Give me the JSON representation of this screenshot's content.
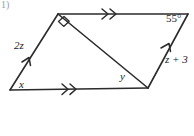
{
  "figure": {
    "type": "parallelogram-with-diagonal",
    "problem_number": "1)",
    "background_color": "#ffffff",
    "stroke_color": "#2b2b2b",
    "label_color": "#1c1c1c",
    "vertices": {
      "bottom_left": {
        "x": 10,
        "y": 90
      },
      "top_left": {
        "x": 58,
        "y": 14
      },
      "top_right": {
        "x": 188,
        "y": 14
      },
      "bottom_right": {
        "x": 148,
        "y": 88
      }
    },
    "sides": [
      {
        "name": "top-side",
        "from": "top_left",
        "to": "top_right",
        "tick_mark": "double-arrow",
        "label": ""
      },
      {
        "name": "bottom-side",
        "from": "bottom_left",
        "to": "bottom_right",
        "tick_mark": "double-arrow",
        "label": ""
      },
      {
        "name": "left-side",
        "from": "bottom_left",
        "to": "top_left",
        "tick_mark": "single-arrow",
        "label": "2z"
      },
      {
        "name": "right-side",
        "from": "bottom_right",
        "to": "top_right",
        "tick_mark": "single-arrow",
        "label": "z + 3"
      }
    ],
    "diagonal": {
      "name": "diagonal",
      "from": "top_left",
      "to": "bottom_right"
    },
    "angles": [
      {
        "name": "angle-x",
        "at": "bottom_left",
        "label": "x",
        "marker": "none"
      },
      {
        "name": "angle-right-angle",
        "at": "top_left",
        "label": "",
        "marker": "right-angle-square"
      },
      {
        "name": "angle-55",
        "at": "top_right",
        "label": "55°",
        "marker": "none"
      },
      {
        "name": "angle-y",
        "at": "bottom_right",
        "label": "y",
        "marker": "none"
      }
    ],
    "labels": {
      "left_side_expression": "2z",
      "right_side_expression": "z + 3",
      "angle_x": "x",
      "angle_y": "y",
      "angle_measure": "55°"
    }
  }
}
